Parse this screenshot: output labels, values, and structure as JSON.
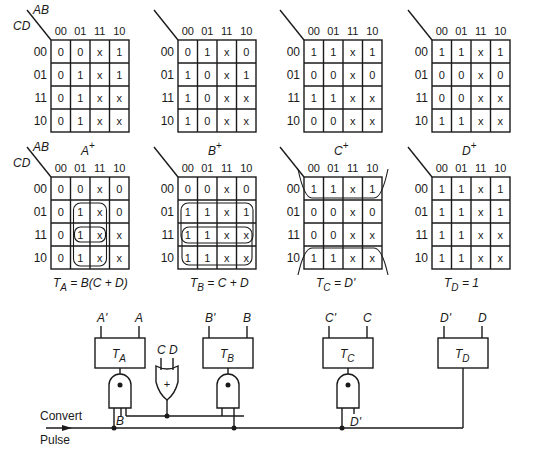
{
  "diagram": {
    "col_labels": [
      "00",
      "01",
      "11",
      "10"
    ],
    "row_labels": [
      "00",
      "01",
      "11",
      "10"
    ],
    "axis_ab": "AB",
    "axis_cd": "CD",
    "next_state_maps": [
      {
        "id": "A+",
        "label": "A",
        "sup": "+",
        "cells": [
          [
            "0",
            "0",
            "x",
            "1"
          ],
          [
            "0",
            "1",
            "x",
            "1"
          ],
          [
            "0",
            "1",
            "x",
            "x"
          ],
          [
            "0",
            "1",
            "x",
            "x"
          ]
        ]
      },
      {
        "id": "B+",
        "label": "B",
        "sup": "+",
        "cells": [
          [
            "0",
            "1",
            "x",
            "0"
          ],
          [
            "1",
            "0",
            "x",
            "1"
          ],
          [
            "1",
            "0",
            "x",
            "x"
          ],
          [
            "1",
            "0",
            "x",
            "x"
          ]
        ]
      },
      {
        "id": "C+",
        "label": "C",
        "sup": "+",
        "cells": [
          [
            "1",
            "1",
            "x",
            "1"
          ],
          [
            "0",
            "0",
            "x",
            "0"
          ],
          [
            "1",
            "1",
            "x",
            "x"
          ],
          [
            "0",
            "0",
            "x",
            "x"
          ]
        ]
      },
      {
        "id": "D+",
        "label": "D",
        "sup": "+",
        "cells": [
          [
            "1",
            "1",
            "x",
            "1"
          ],
          [
            "0",
            "0",
            "x",
            "0"
          ],
          [
            "0",
            "0",
            "x",
            "x"
          ],
          [
            "1",
            "1",
            "x",
            "x"
          ]
        ]
      }
    ],
    "t_maps": [
      {
        "id": "TA",
        "equation": "T_A = B(C + D)",
        "lhs": "T",
        "sub": "A",
        "rhs": " = B(C + D)",
        "cells": [
          [
            "0",
            "0",
            "x",
            "0"
          ],
          [
            "0",
            "1",
            "x",
            "0"
          ],
          [
            "0",
            "1",
            "x",
            "x"
          ],
          [
            "0",
            "1",
            "x",
            "x"
          ]
        ]
      },
      {
        "id": "TB",
        "equation": "T_B = C + D",
        "lhs": "T",
        "sub": "B",
        "rhs": " = C + D",
        "cells": [
          [
            "0",
            "0",
            "x",
            "0"
          ],
          [
            "1",
            "1",
            "x",
            "1"
          ],
          [
            "1",
            "1",
            "x",
            "x"
          ],
          [
            "1",
            "1",
            "x",
            "x"
          ]
        ]
      },
      {
        "id": "TC",
        "equation": "T_C = D'",
        "lhs": "T",
        "sub": "C",
        "rhs": " = D'",
        "cells": [
          [
            "1",
            "1",
            "x",
            "1"
          ],
          [
            "0",
            "0",
            "x",
            "0"
          ],
          [
            "0",
            "0",
            "x",
            "x"
          ],
          [
            "1",
            "1",
            "x",
            "x"
          ]
        ]
      },
      {
        "id": "TD",
        "equation": "T_D = 1",
        "lhs": "T",
        "sub": "D",
        "rhs": " = 1",
        "cells": [
          [
            "1",
            "1",
            "x",
            "1"
          ],
          [
            "1",
            "1",
            "x",
            "1"
          ],
          [
            "1",
            "1",
            "x",
            "x"
          ],
          [
            "1",
            "1",
            "x",
            "x"
          ]
        ]
      }
    ],
    "circuit": {
      "flip_flops": [
        {
          "name": "T",
          "sub": "A",
          "out_left": "A'",
          "out_right": "A"
        },
        {
          "name": "T",
          "sub": "B",
          "out_left": "B'",
          "out_right": "B"
        },
        {
          "name": "T",
          "sub": "C",
          "out_left": "C'",
          "out_right": "C"
        },
        {
          "name": "T",
          "sub": "D",
          "out_left": "D'",
          "out_right": "D"
        }
      ],
      "or_gate_inputs": "C D",
      "or_symbol": "+",
      "and_input_labels": {
        "a": "B",
        "c": "D'"
      },
      "input_label_1": "Convert",
      "input_label_2": "Pulse"
    }
  }
}
